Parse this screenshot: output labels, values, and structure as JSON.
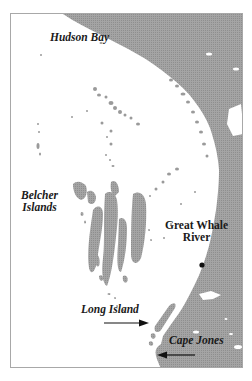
{
  "map": {
    "title": "Eastern Hudson Bay",
    "colors": {
      "land": "#9a9a9a",
      "water": "#ffffff",
      "frame": "#a8a8a8",
      "text": "#1a1a1a"
    },
    "labels": {
      "hudson_bay": "Hudson Bay",
      "belcher_islands": "Belcher\nIslands",
      "great_whale_river": "Great Whale\nRiver",
      "long_island": "Long Island",
      "cape_jones": "Cape Jones"
    },
    "markers": [
      {
        "name": "Great Whale River",
        "type": "settlement-dot"
      }
    ],
    "arrows": [
      {
        "target": "Long Island",
        "direction": "right"
      },
      {
        "target": "Cape Jones",
        "direction": "left"
      }
    ]
  }
}
